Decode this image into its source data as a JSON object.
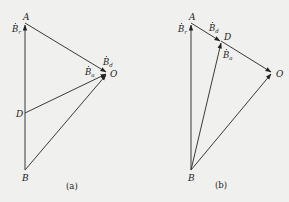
{
  "panels": [
    {
      "caption": "(a)",
      "points": {
        "A": "A",
        "O": "O",
        "D": "D",
        "B": "B"
      },
      "vectors": [
        {
          "from": "B",
          "to": "A",
          "label": "B",
          "subscript": "r"
        },
        {
          "from": "A",
          "to": "O",
          "label": "B",
          "subscript": "d"
        },
        {
          "from": "D",
          "to": "O",
          "label": "B",
          "subscript": "a"
        },
        {
          "from": "B",
          "to": "O",
          "label": "",
          "subscript": ""
        }
      ]
    },
    {
      "caption": "(b)",
      "points": {
        "A": "A",
        "D": "D",
        "O": "O",
        "B": "B"
      },
      "vectors": [
        {
          "from": "B",
          "to": "A",
          "label": "B",
          "subscript": "r"
        },
        {
          "from": "A",
          "to": "D",
          "label": "B",
          "subscript": "d"
        },
        {
          "from": "B",
          "to": "D",
          "label": "B",
          "subscript": "a"
        },
        {
          "from": "D",
          "to": "O",
          "label": "",
          "subscript": ""
        },
        {
          "from": "B",
          "to": "O",
          "label": "",
          "subscript": ""
        }
      ]
    }
  ],
  "colors": {
    "line": "#3a3a3a",
    "background": "#f0f0ee"
  }
}
